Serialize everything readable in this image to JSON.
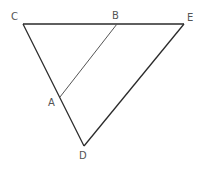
{
  "diagram": {
    "type": "geometry",
    "line_color": "#2a2a2a",
    "inner_line_color": "#555555",
    "label_color": "#555555",
    "points": {
      "C": {
        "label": "C",
        "x": 23,
        "y": 24,
        "label_x": 11,
        "label_y": 20
      },
      "B": {
        "label": "B",
        "x": 117,
        "y": 24,
        "label_x": 112,
        "label_y": 19
      },
      "E": {
        "label": "E",
        "x": 184,
        "y": 24,
        "label_x": 187,
        "label_y": 21
      },
      "A": {
        "label": "A",
        "x": 60,
        "y": 97,
        "label_x": 48,
        "label_y": 106
      },
      "D": {
        "label": "D",
        "x": 84,
        "y": 146,
        "label_x": 79,
        "label_y": 159
      }
    },
    "segments": [
      {
        "from": "C",
        "to": "E",
        "style": "main"
      },
      {
        "from": "C",
        "to": "D",
        "style": "main"
      },
      {
        "from": "D",
        "to": "E",
        "style": "main"
      },
      {
        "from": "A",
        "to": "B",
        "style": "inner"
      }
    ]
  }
}
